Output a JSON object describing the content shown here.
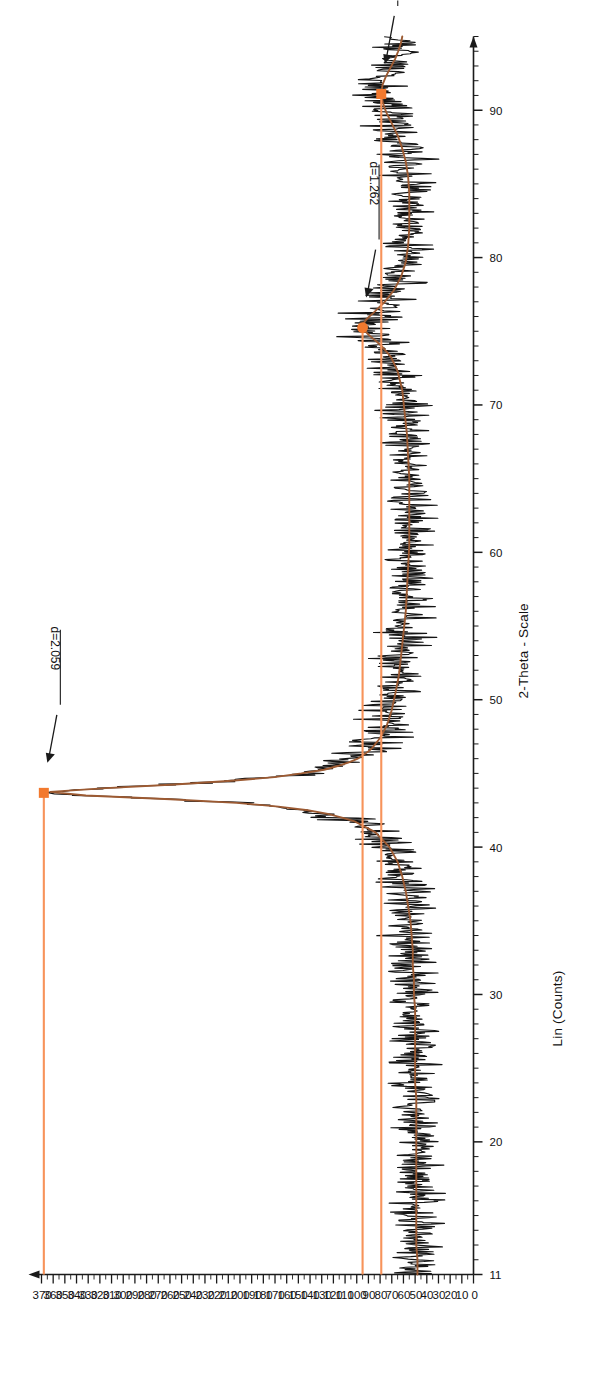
{
  "figure": {
    "type": "xrd-diffractogram",
    "orientation": "rotated-90-ccw"
  },
  "chart_data": {
    "type": "line",
    "title": "",
    "subtitle": "",
    "xlabel": "2-Theta - Scale",
    "ylabel": "Lin (Counts)",
    "xlim": [
      11,
      95
    ],
    "ylim": [
      0,
      370
    ],
    "grid": false,
    "legend": null,
    "x_ticks": [
      11,
      20,
      30,
      40,
      50,
      60,
      70,
      80,
      90
    ],
    "x_tick_labels": [
      "11",
      "20",
      "30",
      "40",
      "50",
      "60",
      "70",
      "80",
      "90"
    ],
    "x_minor_step": 1,
    "y_ticks": [
      0,
      10,
      20,
      30,
      40,
      50,
      60,
      70,
      80,
      90,
      100,
      110,
      120,
      130,
      140,
      150,
      160,
      170,
      180,
      190,
      200,
      210,
      220,
      230,
      240,
      250,
      260,
      270,
      280,
      290,
      300,
      310,
      320,
      330,
      340,
      350,
      360,
      370
    ],
    "y_tick_labels": [
      "0",
      "10",
      "20",
      "30",
      "40",
      "50",
      "60",
      "70",
      "80",
      "90",
      "100",
      "110",
      "120",
      "130",
      "140",
      "150",
      "160",
      "170",
      "180",
      "190",
      "200",
      "210",
      "220",
      "230",
      "240",
      "250",
      "260",
      "270",
      "280",
      "290",
      "300",
      "310",
      "320",
      "330",
      "340",
      "350",
      "360",
      "370"
    ],
    "colors": {
      "raw_trace": "#141414",
      "fit_trace": "#9c5a32",
      "marker": "#f2792e",
      "leader_line": "#f7935a",
      "axis": "#1a1a1a"
    },
    "series": [
      {
        "name": "Raw counts (measured)",
        "color": "#141414",
        "style": "noisy-line",
        "noise_amplitude": 9
      },
      {
        "name": "Smoothed profile (fit)",
        "color": "#9c5a32",
        "style": "line",
        "points": [
          [
            11,
            48
          ],
          [
            12,
            48
          ],
          [
            13,
            49
          ],
          [
            14,
            49
          ],
          [
            15,
            49
          ],
          [
            16,
            49
          ],
          [
            17,
            49
          ],
          [
            18,
            49
          ],
          [
            19,
            49
          ],
          [
            20,
            49
          ],
          [
            21,
            49
          ],
          [
            22,
            49
          ],
          [
            23,
            49
          ],
          [
            24,
            50
          ],
          [
            25,
            50
          ],
          [
            26,
            50
          ],
          [
            27,
            50
          ],
          [
            28,
            50
          ],
          [
            29,
            50
          ],
          [
            30,
            51
          ],
          [
            31,
            51
          ],
          [
            32,
            52
          ],
          [
            33,
            52
          ],
          [
            34,
            53
          ],
          [
            35,
            54
          ],
          [
            36,
            56
          ],
          [
            37,
            58
          ],
          [
            38,
            61
          ],
          [
            39,
            65
          ],
          [
            40,
            72
          ],
          [
            41,
            84
          ],
          [
            41.8,
            103
          ],
          [
            42.4,
            132
          ],
          [
            42.9,
            182
          ],
          [
            43.2,
            245
          ],
          [
            43.45,
            318
          ],
          [
            43.6,
            360
          ],
          [
            43.7,
            368
          ],
          [
            43.85,
            352
          ],
          [
            44.1,
            290
          ],
          [
            44.4,
            222
          ],
          [
            44.8,
            163
          ],
          [
            45.3,
            124
          ],
          [
            45.9,
            101
          ],
          [
            46.6,
            88
          ],
          [
            47.4,
            80
          ],
          [
            48.3,
            74
          ],
          [
            49.3,
            70
          ],
          [
            50.4,
            67
          ],
          [
            51.6,
            64
          ],
          [
            53,
            62
          ],
          [
            54.5,
            60
          ],
          [
            56,
            58
          ],
          [
            57.5,
            57
          ],
          [
            59,
            56
          ],
          [
            60.5,
            55
          ],
          [
            62,
            55
          ],
          [
            63.5,
            55
          ],
          [
            65,
            55
          ],
          [
            66.5,
            56
          ],
          [
            68,
            57
          ],
          [
            69.5,
            59
          ],
          [
            71,
            61
          ],
          [
            72.3,
            65
          ],
          [
            73.3,
            71
          ],
          [
            74.1,
            80
          ],
          [
            74.7,
            89
          ],
          [
            75.1,
            94
          ],
          [
            75.4,
            95
          ],
          [
            75.8,
            92
          ],
          [
            76.3,
            85
          ],
          [
            77,
            76
          ],
          [
            77.8,
            68
          ],
          [
            78.7,
            62
          ],
          [
            79.7,
            58
          ],
          [
            80.8,
            56
          ],
          [
            82,
            55
          ],
          [
            83.2,
            55
          ],
          [
            84.4,
            55
          ],
          [
            85.5,
            56
          ],
          [
            86.5,
            58
          ],
          [
            87.4,
            61
          ],
          [
            88.3,
            65
          ],
          [
            89.1,
            70
          ],
          [
            89.9,
            75
          ],
          [
            90.6,
            78
          ],
          [
            91.2,
            79
          ],
          [
            91.7,
            78
          ],
          [
            92.3,
            75
          ],
          [
            92.9,
            71
          ],
          [
            93.5,
            67
          ],
          [
            94.1,
            64
          ],
          [
            94.6,
            62
          ],
          [
            95,
            61
          ]
        ]
      }
    ],
    "annotations": [
      {
        "label": "d=2.059",
        "two_theta": 43.68,
        "intensity": 368,
        "d_spacing": 2.059,
        "marker": "square"
      },
      {
        "label": "d=1.262",
        "two_theta": 75.25,
        "intensity": 95,
        "d_spacing": 1.262,
        "marker": "circle"
      },
      {
        "label": "d=1.079",
        "two_theta": 91.1,
        "intensity": 79,
        "d_spacing": 1.079,
        "marker": "square"
      }
    ]
  }
}
